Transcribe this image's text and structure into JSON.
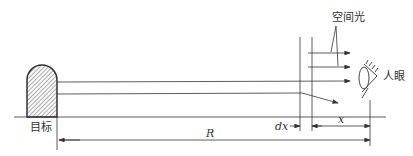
{
  "diagram": {
    "labels": {
      "target": "目标",
      "space_light": "空间光",
      "human_eye": "人眼",
      "range": "R",
      "dx": "dx",
      "x": "x"
    },
    "colors": {
      "line": "#333333",
      "hatch": "#555555",
      "background": "#ffffff"
    }
  }
}
